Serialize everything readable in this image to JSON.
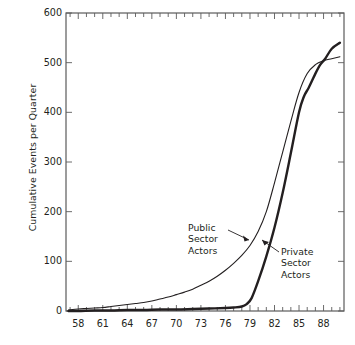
{
  "chart_data": {
    "type": "line",
    "title": "",
    "xlabel": "",
    "ylabel": "Cumulative Events per Quarter",
    "xlim": [
      1956.5,
      1990.5
    ],
    "ylim": [
      0,
      600
    ],
    "y_ticks": [
      0,
      100,
      200,
      300,
      400,
      500,
      600
    ],
    "y_tick_labels": [
      "0",
      "100",
      "200",
      "300",
      "400",
      "500",
      "600"
    ],
    "x_ticks": [
      1958,
      1961,
      1964,
      1967,
      1970,
      1973,
      1976,
      1979,
      1982,
      1985,
      1988
    ],
    "x_tick_labels": [
      "58",
      "61",
      "64",
      "67",
      "70",
      "73",
      "76",
      "79",
      "82",
      "85",
      "88"
    ],
    "x_minor_tick_interval": 1,
    "grid": false,
    "legend_position": "inline-annotations",
    "frame": "box",
    "tick_direction": "in",
    "series": [
      {
        "name": "Public Sector Actors",
        "style": "thin",
        "color": "#231f20",
        "x": [
          1956.8,
          1958.0,
          1959.0,
          1960.0,
          1961.0,
          1962.0,
          1963.0,
          1964.0,
          1965.0,
          1966.0,
          1967.0,
          1968.0,
          1969.0,
          1970.0,
          1971.0,
          1972.0,
          1973.0,
          1974.0,
          1975.0,
          1976.0,
          1977.0,
          1978.0,
          1979.0,
          1980.0,
          1981.0,
          1982.0,
          1983.0,
          1984.0,
          1985.0,
          1986.0,
          1987.0,
          1988.0,
          1989.0,
          1990.0
        ],
        "y": [
          2,
          4,
          5,
          6,
          7,
          9,
          11,
          13,
          15,
          17,
          20,
          24,
          28,
          33,
          38,
          44,
          52,
          60,
          70,
          82,
          96,
          112,
          132,
          160,
          200,
          258,
          320,
          382,
          440,
          478,
          496,
          504,
          508,
          512
        ]
      },
      {
        "name": "Private Sector Actors",
        "style": "thick",
        "color": "#231f20",
        "x": [
          1956.8,
          1958.0,
          1960.0,
          1962.0,
          1964.0,
          1966.0,
          1968.0,
          1970.0,
          1972.0,
          1974.0,
          1976.0,
          1977.0,
          1978.0,
          1978.6,
          1979.2,
          1980.0,
          1981.0,
          1982.0,
          1983.0,
          1984.0,
          1985.0,
          1985.6,
          1986.2,
          1987.0,
          1987.6,
          1988.2,
          1989.0,
          1990.0
        ],
        "y": [
          0,
          0,
          1,
          1,
          2,
          2,
          3,
          3,
          4,
          5,
          6,
          7,
          9,
          14,
          26,
          60,
          110,
          168,
          238,
          318,
          400,
          432,
          450,
          478,
          496,
          508,
          528,
          540
        ]
      }
    ],
    "annotations": [
      {
        "name": "public-sector-actors",
        "text_lines": [
          "Public",
          "Sector",
          "Actors"
        ],
        "points_to": "thin curve"
      },
      {
        "name": "private-sector-actors",
        "text_lines": [
          "Private",
          "Sector",
          "Actors"
        ],
        "points_to": "thick curve"
      }
    ]
  },
  "axis": {
    "ylabel": "Cumulative Events per Quarter"
  },
  "annotations": {
    "public": {
      "line1": "Public",
      "line2": "Sector",
      "line3": "Actors"
    },
    "private": {
      "line1": "Private",
      "line2": "Sector",
      "line3": "Actors"
    }
  }
}
